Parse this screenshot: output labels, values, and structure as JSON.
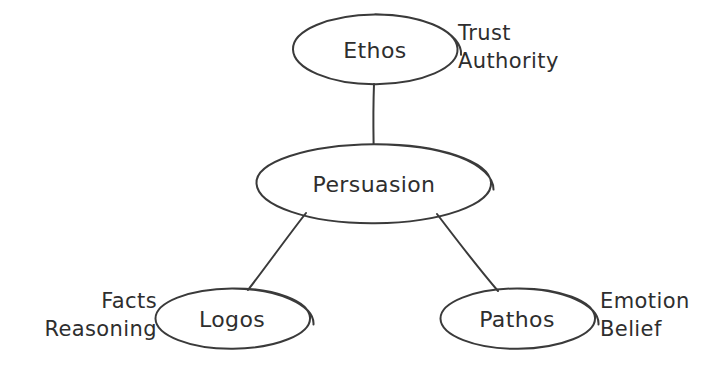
{
  "diagram": {
    "title": "Persuasion",
    "style": "hand-drawn concept map",
    "background_color": "#ffffff",
    "ink_color": "#2e2e2e",
    "nodes": [
      {
        "id": "persuasion",
        "label": "Persuasion",
        "role": "center",
        "cx": 374,
        "cy": 183,
        "rx": 118,
        "ry": 39
      },
      {
        "id": "ethos",
        "label": "Ethos",
        "role": "branch",
        "cx": 375,
        "cy": 49,
        "rx": 82,
        "ry": 35
      },
      {
        "id": "logos",
        "label": "Logos",
        "role": "branch",
        "cx": 232,
        "cy": 318,
        "rx": 77,
        "ry": 30
      },
      {
        "id": "pathos",
        "label": "Pathos",
        "role": "branch",
        "cx": 517,
        "cy": 318,
        "rx": 77,
        "ry": 30
      }
    ],
    "side_labels": [
      {
        "id": "ethos-attributes",
        "for": "ethos",
        "side": "right",
        "x": 458,
        "y": 47,
        "lines": [
          "Trust",
          "Authority"
        ]
      },
      {
        "id": "logos-attributes",
        "for": "logos",
        "side": "left",
        "x": 157,
        "y": 315,
        "lines": [
          "Facts",
          "Reasoning"
        ]
      },
      {
        "id": "pathos-attributes",
        "for": "pathos",
        "side": "right",
        "x": 600,
        "y": 315,
        "lines": [
          "Emotion",
          "Belief"
        ]
      }
    ],
    "connectors": [
      {
        "id": "ethos-persuasion",
        "from": "ethos",
        "to": "persuasion"
      },
      {
        "id": "persuasion-logos",
        "from": "persuasion",
        "to": "logos"
      },
      {
        "id": "persuasion-pathos",
        "from": "persuasion",
        "to": "pathos"
      }
    ]
  }
}
